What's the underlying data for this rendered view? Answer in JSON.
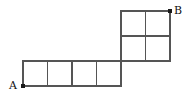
{
  "figure": {
    "background_color": "#ffffff",
    "line_color": "#555555",
    "dot_color": "#1a1a1a",
    "label_color": "#111111",
    "unit_cell_px": 24.5,
    "labels": {
      "start": "A",
      "end": "B"
    },
    "vertices": {
      "A": {
        "x": 23,
        "y": 86
      },
      "B": {
        "x": 170,
        "y": 11
      }
    },
    "regions": [
      {
        "name": "bottom-row",
        "shape": "1x4 row of unit squares",
        "columns": 4,
        "rows": 1,
        "x0": 23,
        "y0": 61,
        "x1": 121,
        "y1": 86
      },
      {
        "name": "top-block",
        "shape": "2x2 block of unit squares",
        "columns": 2,
        "rows": 2,
        "x0": 121,
        "y0": 11,
        "x1": 170,
        "y1": 61
      }
    ],
    "segments": [
      {
        "name": "bottom-row-top-edge",
        "x1": 23,
        "y1": 61,
        "x2": 121,
        "y2": 61
      },
      {
        "name": "bottom-row-bottom-edge",
        "x1": 23,
        "y1": 86,
        "x2": 121,
        "y2": 86
      },
      {
        "name": "bottom-row-left-edge",
        "x1": 23,
        "y1": 61,
        "x2": 23,
        "y2": 86
      },
      {
        "name": "bottom-row-divider-1",
        "x1": 47.5,
        "y1": 61,
        "x2": 47.5,
        "y2": 86
      },
      {
        "name": "bottom-row-divider-2",
        "x1": 72,
        "y1": 61,
        "x2": 72,
        "y2": 86
      },
      {
        "name": "bottom-row-divider-3",
        "x1": 96.5,
        "y1": 61,
        "x2": 96.5,
        "y2": 86
      },
      {
        "name": "bottom-row-right-edge",
        "x1": 121,
        "y1": 61,
        "x2": 121,
        "y2": 86
      },
      {
        "name": "top-block-top-edge",
        "x1": 121,
        "y1": 11,
        "x2": 170,
        "y2": 11
      },
      {
        "name": "top-block-middle-row",
        "x1": 121,
        "y1": 36,
        "x2": 170,
        "y2": 36
      },
      {
        "name": "top-block-bottom-edge",
        "x1": 121,
        "y1": 61,
        "x2": 170,
        "y2": 61
      },
      {
        "name": "top-block-left-edge",
        "x1": 121,
        "y1": 11,
        "x2": 121,
        "y2": 61
      },
      {
        "name": "top-block-middle-col",
        "x1": 145.5,
        "y1": 11,
        "x2": 145.5,
        "y2": 61
      },
      {
        "name": "top-block-right-edge",
        "x1": 170,
        "y1": 11,
        "x2": 170,
        "y2": 61
      }
    ]
  }
}
